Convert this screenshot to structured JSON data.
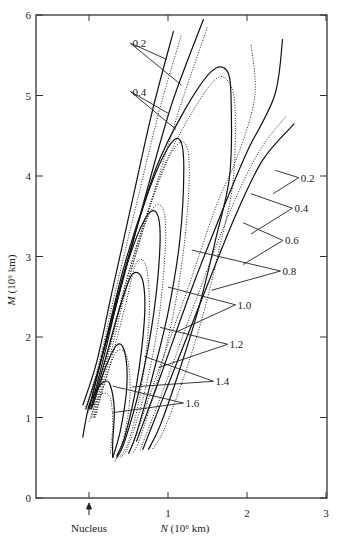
{
  "chart_data": {
    "type": "line",
    "title": "",
    "xlabel": "N (10⁶ km)",
    "ylabel": "M (10⁶ km)",
    "xlim": [
      -0.67,
      3
    ],
    "ylim": [
      0,
      6
    ],
    "x_ticks": [
      {
        "value": 0,
        "label": ""
      },
      {
        "value": 1,
        "label": "1"
      },
      {
        "value": 2,
        "label": "2"
      },
      {
        "value": 3,
        "label": "3"
      }
    ],
    "y_ticks": [
      {
        "value": 0,
        "label": "0"
      },
      {
        "value": 1,
        "label": "1"
      },
      {
        "value": 2,
        "label": "2"
      },
      {
        "value": 3,
        "label": "3"
      },
      {
        "value": 4,
        "label": "4"
      },
      {
        "value": 5,
        "label": "5"
      },
      {
        "value": 6,
        "label": "6"
      }
    ],
    "nucleus": {
      "label": "Nucleus",
      "x": 0
    },
    "grid": false,
    "solid_curves": [
      {
        "name": "syndyne-a",
        "points": [
          [
            -0.08,
            1.15
          ],
          [
            0.1,
            1.7
          ],
          [
            0.3,
            2.6
          ],
          [
            0.55,
            3.7
          ],
          [
            0.8,
            4.8
          ],
          [
            1.07,
            5.8
          ]
        ]
      },
      {
        "name": "syndyne-b",
        "points": [
          [
            -0.04,
            1.1
          ],
          [
            0.15,
            1.7
          ],
          [
            0.4,
            2.6
          ],
          [
            0.7,
            3.7
          ],
          [
            1.05,
            4.9
          ],
          [
            1.45,
            5.95
          ]
        ]
      },
      {
        "name": "loop-1",
        "points": [
          [
            0.0,
            1.1
          ],
          [
            0.2,
            1.9
          ],
          [
            0.5,
            3.0
          ],
          [
            0.85,
            4.1
          ],
          [
            1.2,
            4.8
          ],
          [
            1.55,
            5.3
          ],
          [
            1.75,
            5.3
          ],
          [
            1.8,
            4.9
          ],
          [
            1.78,
            4.0
          ],
          [
            1.6,
            3.2
          ],
          [
            1.4,
            2.4
          ],
          [
            1.15,
            1.6
          ],
          [
            0.9,
            0.9
          ],
          [
            0.75,
            0.6
          ]
        ]
      },
      {
        "name": "loop-2",
        "points": [
          [
            0.0,
            1.1
          ],
          [
            0.2,
            1.9
          ],
          [
            0.45,
            2.9
          ],
          [
            0.75,
            3.8
          ],
          [
            1.0,
            4.35
          ],
          [
            1.15,
            4.45
          ],
          [
            1.2,
            4.1
          ],
          [
            1.15,
            3.2
          ],
          [
            1.0,
            2.3
          ],
          [
            0.8,
            1.5
          ],
          [
            0.6,
            0.8
          ],
          [
            0.5,
            0.55
          ]
        ]
      },
      {
        "name": "loop-3",
        "points": [
          [
            0.02,
            1.1
          ],
          [
            0.2,
            1.8
          ],
          [
            0.45,
            2.8
          ],
          [
            0.7,
            3.45
          ],
          [
            0.85,
            3.55
          ],
          [
            0.9,
            3.2
          ],
          [
            0.82,
            2.3
          ],
          [
            0.65,
            1.4
          ],
          [
            0.45,
            0.7
          ],
          [
            0.35,
            0.5
          ]
        ]
      },
      {
        "name": "loop-4",
        "points": [
          [
            0.03,
            1.1
          ],
          [
            0.2,
            1.7
          ],
          [
            0.4,
            2.4
          ],
          [
            0.55,
            2.78
          ],
          [
            0.68,
            2.7
          ],
          [
            0.7,
            2.2
          ],
          [
            0.6,
            1.4
          ],
          [
            0.45,
            0.75
          ],
          [
            0.35,
            0.52
          ]
        ]
      },
      {
        "name": "loop-5",
        "points": [
          [
            0.05,
            1.15
          ],
          [
            0.2,
            1.6
          ],
          [
            0.35,
            1.9
          ],
          [
            0.45,
            1.82
          ],
          [
            0.48,
            1.4
          ],
          [
            0.4,
            0.85
          ],
          [
            0.3,
            0.5
          ]
        ]
      },
      {
        "name": "loop-6",
        "points": [
          [
            -0.08,
            0.75
          ],
          [
            0.0,
            1.15
          ],
          [
            0.1,
            1.35
          ],
          [
            0.2,
            1.45
          ],
          [
            0.27,
            1.4
          ],
          [
            0.32,
            1.1
          ],
          [
            0.3,
            0.7
          ],
          [
            0.3,
            0.5
          ]
        ]
      },
      {
        "name": "tail-r1",
        "points": [
          [
            0.6,
            0.7
          ],
          [
            0.9,
            1.5
          ],
          [
            1.3,
            2.6
          ],
          [
            1.7,
            3.6
          ],
          [
            2.0,
            4.3
          ],
          [
            2.35,
            5.0
          ],
          [
            2.45,
            5.7
          ]
        ]
      },
      {
        "name": "tail-r2",
        "points": [
          [
            0.68,
            0.6
          ],
          [
            1.0,
            1.4
          ],
          [
            1.4,
            2.4
          ],
          [
            1.85,
            3.5
          ],
          [
            2.2,
            4.2
          ],
          [
            2.6,
            4.65
          ]
        ]
      }
    ],
    "dotted_curves": [
      {
        "name": "syndyne-a-dot",
        "points": [
          [
            -0.05,
            1.1
          ],
          [
            0.12,
            1.65
          ],
          [
            0.33,
            2.55
          ],
          [
            0.6,
            3.65
          ],
          [
            0.9,
            4.85
          ],
          [
            1.17,
            5.75
          ]
        ]
      },
      {
        "name": "syndyne-b-dot",
        "points": [
          [
            -0.02,
            1.05
          ],
          [
            0.2,
            1.7
          ],
          [
            0.45,
            2.55
          ],
          [
            0.78,
            3.65
          ],
          [
            1.15,
            4.85
          ],
          [
            1.5,
            5.85
          ]
        ]
      },
      {
        "name": "loop-1-dot",
        "points": [
          [
            0.03,
            1.0
          ],
          [
            0.25,
            1.85
          ],
          [
            0.55,
            2.95
          ],
          [
            0.9,
            4.0
          ],
          [
            1.25,
            4.7
          ],
          [
            1.6,
            5.2
          ],
          [
            1.78,
            5.15
          ],
          [
            1.85,
            4.8
          ],
          [
            1.82,
            3.9
          ],
          [
            1.65,
            3.1
          ],
          [
            1.45,
            2.3
          ],
          [
            1.2,
            1.5
          ],
          [
            0.95,
            0.85
          ],
          [
            0.8,
            0.6
          ]
        ]
      },
      {
        "name": "loop-2-dot",
        "points": [
          [
            0.05,
            1.0
          ],
          [
            0.25,
            1.8
          ],
          [
            0.5,
            2.8
          ],
          [
            0.8,
            3.7
          ],
          [
            1.05,
            4.3
          ],
          [
            1.22,
            4.4
          ],
          [
            1.27,
            4.0
          ],
          [
            1.2,
            3.1
          ],
          [
            1.05,
            2.2
          ],
          [
            0.85,
            1.4
          ],
          [
            0.65,
            0.75
          ],
          [
            0.55,
            0.55
          ]
        ]
      },
      {
        "name": "loop-3-dot",
        "points": [
          [
            0.06,
            1.0
          ],
          [
            0.25,
            1.7
          ],
          [
            0.5,
            2.7
          ],
          [
            0.75,
            3.5
          ],
          [
            0.92,
            3.62
          ],
          [
            0.97,
            3.2
          ],
          [
            0.88,
            2.2
          ],
          [
            0.7,
            1.3
          ],
          [
            0.5,
            0.65
          ],
          [
            0.4,
            0.5
          ]
        ]
      },
      {
        "name": "loop-4-dot",
        "points": [
          [
            0.07,
            1.0
          ],
          [
            0.25,
            1.6
          ],
          [
            0.45,
            2.35
          ],
          [
            0.6,
            2.92
          ],
          [
            0.73,
            2.85
          ],
          [
            0.76,
            2.2
          ],
          [
            0.65,
            1.3
          ],
          [
            0.5,
            0.7
          ],
          [
            0.38,
            0.5
          ]
        ]
      },
      {
        "name": "loop-5-dot",
        "points": [
          [
            0.08,
            1.0
          ],
          [
            0.2,
            1.45
          ],
          [
            0.35,
            1.82
          ],
          [
            0.48,
            1.75
          ],
          [
            0.52,
            1.3
          ],
          [
            0.45,
            0.8
          ],
          [
            0.33,
            0.45
          ]
        ]
      },
      {
        "name": "loop-6-dot",
        "points": [
          [
            0.0,
            0.95
          ],
          [
            0.12,
            1.25
          ],
          [
            0.22,
            1.3
          ],
          [
            0.28,
            1.2
          ],
          [
            0.3,
            0.9
          ],
          [
            0.27,
            0.55
          ]
        ]
      },
      {
        "name": "tail-r1-dot",
        "points": [
          [
            0.55,
            0.65
          ],
          [
            0.85,
            1.5
          ],
          [
            1.25,
            2.6
          ],
          [
            1.6,
            3.6
          ],
          [
            1.9,
            4.3
          ],
          [
            2.1,
            5.0
          ],
          [
            2.05,
            5.65
          ]
        ]
      },
      {
        "name": "tail-r2-dot",
        "points": [
          [
            0.65,
            0.6
          ],
          [
            0.98,
            1.45
          ],
          [
            1.35,
            2.45
          ],
          [
            1.78,
            3.55
          ],
          [
            2.15,
            4.3
          ],
          [
            2.5,
            4.75
          ]
        ]
      }
    ],
    "annotations": [
      {
        "text": "0.2",
        "at": [
          0.55,
          5.6
        ],
        "targets": [
          [
            0.98,
            5.45
          ],
          [
            1.17,
            5.13
          ]
        ]
      },
      {
        "text": "0.4",
        "at": [
          0.55,
          5.0
        ],
        "targets": [
          [
            1.0,
            4.78
          ],
          [
            1.1,
            4.58
          ]
        ]
      },
      {
        "text": "0.2",
        "at": [
          2.68,
          3.93
        ],
        "targets": [
          [
            2.36,
            4.07
          ],
          [
            2.33,
            3.78
          ]
        ]
      },
      {
        "text": "0.4",
        "at": [
          2.6,
          3.55
        ],
        "targets": [
          [
            2.05,
            3.78
          ],
          [
            2.05,
            3.28
          ]
        ]
      },
      {
        "text": "0.6",
        "at": [
          2.48,
          3.15
        ],
        "targets": [
          [
            1.95,
            3.42
          ],
          [
            1.95,
            2.9
          ]
        ]
      },
      {
        "text": "0.8",
        "at": [
          2.45,
          2.77
        ],
        "targets": [
          [
            1.3,
            3.08
          ],
          [
            1.55,
            2.58
          ]
        ]
      },
      {
        "text": "1.0",
        "at": [
          1.88,
          2.35
        ],
        "targets": [
          [
            1.0,
            2.62
          ],
          [
            1.1,
            2.06
          ]
        ]
      },
      {
        "text": "1.2",
        "at": [
          1.78,
          1.86
        ],
        "targets": [
          [
            0.9,
            2.12
          ],
          [
            0.88,
            1.62
          ]
        ]
      },
      {
        "text": "1.4",
        "at": [
          1.6,
          1.4
        ],
        "targets": [
          [
            0.7,
            1.76
          ],
          [
            0.55,
            1.38
          ]
        ]
      },
      {
        "text": "1.6",
        "at": [
          1.22,
          1.13
        ],
        "targets": [
          [
            0.3,
            1.39
          ],
          [
            0.3,
            1.06
          ]
        ]
      }
    ]
  }
}
